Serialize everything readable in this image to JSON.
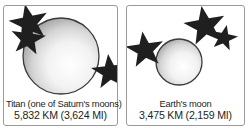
{
  "figure": {
    "type": "comparison-illustration",
    "background_color": "#ffffff",
    "border_color": "#9a9a9a",
    "text_color": "#231f20"
  },
  "panels": [
    {
      "id": "titan",
      "caption_line1": "Titan (one of Saturn's moons)",
      "caption_line2": "5,832 KM (3,624 MI)",
      "body_name": "Titan",
      "diameter_km": "5,832 KM",
      "diameter_mi": "3,624 MI",
      "sphere": {
        "name": "titan-sphere",
        "cx": 57,
        "cy": 50,
        "r": 38,
        "fill_light": "#ffffff",
        "fill_dark": "#8d8d8d",
        "outline": "#3a3a3a"
      },
      "stars": [
        {
          "name": "star-upper-left-large",
          "cx": 25,
          "cy": 17,
          "r": 7.0,
          "rot": -12
        },
        {
          "name": "star-upper-left-small",
          "cx": 24,
          "cy": 33,
          "r": 6.2,
          "rot": 8
        },
        {
          "name": "star-right",
          "cx": 106,
          "cy": 66,
          "r": 6.6,
          "rot": -6
        }
      ]
    },
    {
      "id": "earths-moon",
      "caption_line1": "Earth's moon",
      "caption_line2": "3,475 KM (2,159 MI)",
      "body_name": "Earth's moon",
      "diameter_km": "3,475 KM",
      "diameter_mi": "2,159 MI",
      "sphere": {
        "name": "moon-sphere",
        "cx": 52,
        "cy": 56,
        "r": 23,
        "fill_light": "#ffffff",
        "fill_dark": "#8d8d8d",
        "outline": "#3a3a3a"
      },
      "stars": [
        {
          "name": "star-top-large",
          "cx": 78,
          "cy": 20,
          "r": 7.4,
          "rot": -10
        },
        {
          "name": "star-top-small",
          "cx": 97,
          "cy": 32,
          "r": 4.8,
          "rot": 12
        },
        {
          "name": "star-left",
          "cx": 18,
          "cy": 44,
          "r": 6.8,
          "rot": -8
        }
      ]
    }
  ]
}
